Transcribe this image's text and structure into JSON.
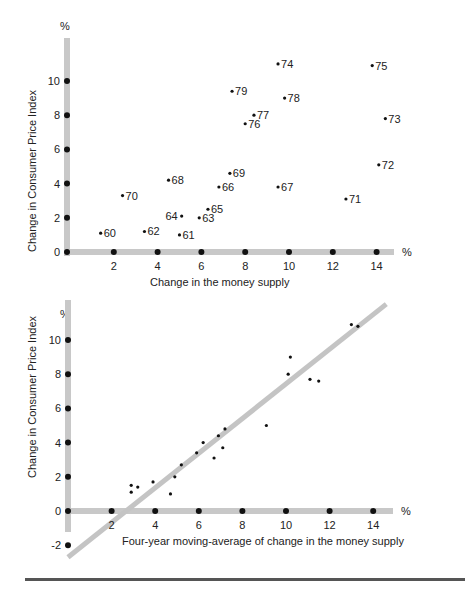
{
  "chart_data": [
    {
      "type": "scatter",
      "title": "",
      "xlabel": "Change in the money supply",
      "ylabel": "Change in Consumer Price Index",
      "x_unit": "%",
      "y_unit": "%",
      "xlim": [
        0,
        15
      ],
      "ylim": [
        0,
        12
      ],
      "x_ticks": [
        2,
        4,
        6,
        8,
        10,
        12,
        14
      ],
      "y_ticks": [
        0,
        2,
        4,
        6,
        8,
        10
      ],
      "grid": false,
      "points": [
        {
          "label": "60",
          "x": 1.4,
          "y": 1.1
        },
        {
          "label": "61",
          "x": 5.0,
          "y": 1.0
        },
        {
          "label": "62",
          "x": 3.4,
          "y": 1.2
        },
        {
          "label": "63",
          "x": 5.9,
          "y": 2.0
        },
        {
          "label": "64",
          "x": 5.1,
          "y": 2.1
        },
        {
          "label": "65",
          "x": 6.3,
          "y": 2.5
        },
        {
          "label": "66",
          "x": 6.8,
          "y": 3.8
        },
        {
          "label": "67",
          "x": 9.5,
          "y": 3.8
        },
        {
          "label": "68",
          "x": 4.5,
          "y": 4.2
        },
        {
          "label": "69",
          "x": 7.3,
          "y": 4.6
        },
        {
          "label": "70",
          "x": 2.4,
          "y": 3.3
        },
        {
          "label": "71",
          "x": 12.6,
          "y": 3.1
        },
        {
          "label": "72",
          "x": 14.1,
          "y": 5.1
        },
        {
          "label": "73",
          "x": 14.4,
          "y": 7.8
        },
        {
          "label": "74",
          "x": 9.5,
          "y": 11.0
        },
        {
          "label": "75",
          "x": 13.8,
          "y": 10.9
        },
        {
          "label": "76",
          "x": 8.0,
          "y": 7.5
        },
        {
          "label": "77",
          "x": 8.4,
          "y": 8.0
        },
        {
          "label": "78",
          "x": 9.8,
          "y": 9.0
        },
        {
          "label": "79",
          "x": 7.4,
          "y": 9.4
        }
      ]
    },
    {
      "type": "scatter",
      "title": "",
      "xlabel": "Four-year moving-average of change in the money supply",
      "ylabel": "Change in Consumer Price Index",
      "x_unit": "%",
      "y_unit": "%",
      "xlim": [
        0,
        15
      ],
      "ylim": [
        -3,
        12
      ],
      "x_ticks": [
        2,
        4,
        6,
        8,
        10,
        12,
        14
      ],
      "y_ticks": [
        -2,
        0,
        2,
        4,
        6,
        8,
        10
      ],
      "grid": false,
      "trend_line": {
        "x1": 0,
        "y1": -2.7,
        "x2": 14.6,
        "y2": 12.1
      },
      "points": [
        {
          "x": 2.9,
          "y": 1.5
        },
        {
          "x": 2.9,
          "y": 1.1
        },
        {
          "x": 3.2,
          "y": 1.4
        },
        {
          "x": 3.9,
          "y": 1.7
        },
        {
          "x": 4.7,
          "y": 1.0
        },
        {
          "x": 4.9,
          "y": 2.0
        },
        {
          "x": 5.2,
          "y": 2.7
        },
        {
          "x": 5.9,
          "y": 3.4
        },
        {
          "x": 6.2,
          "y": 4.0
        },
        {
          "x": 6.7,
          "y": 3.1
        },
        {
          "x": 6.9,
          "y": 4.4
        },
        {
          "x": 7.1,
          "y": 3.7
        },
        {
          "x": 7.2,
          "y": 4.8
        },
        {
          "x": 9.1,
          "y": 5.0
        },
        {
          "x": 10.1,
          "y": 8.0
        },
        {
          "x": 10.2,
          "y": 9.0
        },
        {
          "x": 11.1,
          "y": 7.7
        },
        {
          "x": 11.5,
          "y": 7.6
        },
        {
          "x": 13.0,
          "y": 10.9
        },
        {
          "x": 13.3,
          "y": 10.8
        }
      ]
    }
  ],
  "top": {
    "y_unit": "%",
    "x_unit": "%",
    "ylabel": "Change in Consumer Price Index",
    "xlabel": "Change in the money supply",
    "y_tick_labels": [
      "0",
      "2",
      "4",
      "6",
      "8",
      "10"
    ],
    "x_tick_labels": [
      "2",
      "4",
      "6",
      "8",
      "10",
      "12",
      "14"
    ]
  },
  "bottom": {
    "y_unit": "%",
    "x_unit": "%",
    "ylabel": "Change in Consumer Price Index",
    "xlabel": "Four-year moving-average of change in the money supply",
    "y_tick_labels": [
      "-2",
      "0",
      "2",
      "4",
      "6",
      "8",
      "10"
    ],
    "x_tick_labels": [
      "2",
      "4",
      "6",
      "8",
      "10",
      "12",
      "14"
    ]
  },
  "colors": {
    "axis": "#c8c8c8",
    "trend": "#c4c4c4",
    "point": "#111111",
    "text": "#222222",
    "rule": "#555555"
  }
}
